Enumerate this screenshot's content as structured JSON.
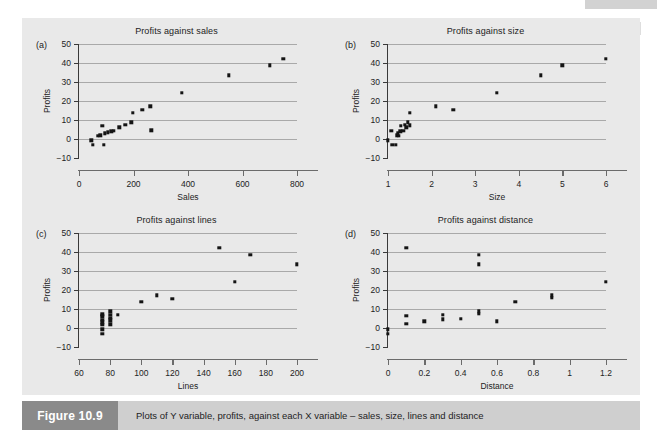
{
  "figure": {
    "label": "Figure 10.9",
    "caption": "Plots of Y variable, profits, against each X variable – sales, size, lines and distance",
    "panel_background": "#e9e9e9",
    "label_background": "#8a8a8a",
    "caption_background": "#cfcfcf",
    "marker_color": "#141414",
    "gridline_color": "#a9a9a9"
  },
  "panels": [
    {
      "letter": "(a)",
      "key": "sales"
    },
    {
      "letter": "(b)",
      "key": "size"
    },
    {
      "letter": "(c)",
      "key": "lines"
    },
    {
      "letter": "(d)",
      "key": "distance"
    }
  ],
  "chart_data": [
    {
      "id": "sales",
      "type": "scatter",
      "title": "Profits against sales",
      "xlabel": "Sales",
      "ylabel": "Profits",
      "xlim": [
        0,
        800
      ],
      "ylim": [
        -10,
        50
      ],
      "xticks": [
        0,
        200,
        400,
        600,
        800
      ],
      "yticks": [
        -10,
        0,
        10,
        20,
        30,
        40,
        50
      ],
      "xticklabels": [
        "0",
        "200",
        "400",
        "600",
        "800"
      ],
      "yticklabels": [
        "−10",
        "0",
        "10",
        "20",
        "30",
        "40",
        "50"
      ],
      "grid": "horizontal",
      "legend": "none",
      "points": [
        [
          45,
          -0.6
        ],
        [
          50,
          -3.2
        ],
        [
          70,
          1.7
        ],
        [
          78,
          2.0
        ],
        [
          85,
          6.8
        ],
        [
          90,
          -3.1
        ],
        [
          95,
          3.0
        ],
        [
          105,
          3.6
        ],
        [
          118,
          4.0
        ],
        [
          128,
          4.3
        ],
        [
          148,
          6.1
        ],
        [
          170,
          7.4
        ],
        [
          192,
          8.8
        ],
        [
          198,
          13.7
        ],
        [
          232,
          15.4
        ],
        [
          262,
          17.2
        ],
        [
          266,
          4.5
        ],
        [
          378,
          24.4
        ],
        [
          550,
          33.6
        ],
        [
          700,
          38.7
        ],
        [
          750,
          42.2
        ]
      ]
    },
    {
      "id": "size",
      "type": "scatter",
      "title": "Profits against size",
      "xlabel": "Size",
      "ylabel": "Profits",
      "xlim": [
        1,
        6
      ],
      "ylim": [
        -10,
        50
      ],
      "xticks": [
        1,
        2,
        3,
        4,
        5,
        6
      ],
      "yticks": [
        -10,
        0,
        10,
        20,
        30,
        40,
        50
      ],
      "xticklabels": [
        "1",
        "2",
        "3",
        "4",
        "5",
        "6"
      ],
      "yticklabels": [
        "−10",
        "0",
        "10",
        "20",
        "30",
        "40",
        "50"
      ],
      "grid": "horizontal",
      "legend": "none",
      "points": [
        [
          1.0,
          -0.6
        ],
        [
          1.08,
          4.3
        ],
        [
          1.1,
          -3.2
        ],
        [
          1.18,
          -3.1
        ],
        [
          1.2,
          2.0
        ],
        [
          1.22,
          3.0
        ],
        [
          1.25,
          1.7
        ],
        [
          1.28,
          4.0
        ],
        [
          1.3,
          6.8
        ],
        [
          1.35,
          4.3
        ],
        [
          1.38,
          7.4
        ],
        [
          1.42,
          6.1
        ],
        [
          1.45,
          8.8
        ],
        [
          1.5,
          7.2
        ],
        [
          1.5,
          13.7
        ],
        [
          2.1,
          17.2
        ],
        [
          2.5,
          15.4
        ],
        [
          3.5,
          24.4
        ],
        [
          4.5,
          33.6
        ],
        [
          5.0,
          38.7
        ],
        [
          6.0,
          42.2
        ]
      ]
    },
    {
      "id": "lines",
      "type": "scatter",
      "title": "Profits against lines",
      "xlabel": "Lines",
      "ylabel": "Profits",
      "xlim": [
        60,
        200
      ],
      "ylim": [
        -10,
        50
      ],
      "xticks": [
        60,
        80,
        100,
        120,
        140,
        160,
        180,
        200
      ],
      "yticks": [
        -10,
        0,
        10,
        20,
        30,
        40,
        50
      ],
      "xticklabels": [
        "60",
        "80",
        "100",
        "120",
        "140",
        "160",
        "180",
        "200"
      ],
      "yticklabels": [
        "−10",
        "0",
        "10",
        "20",
        "30",
        "40",
        "50"
      ],
      "grid": "horizontal",
      "legend": "none",
      "points": [
        [
          75,
          -3.2
        ],
        [
          75,
          -0.6
        ],
        [
          75,
          1.7
        ],
        [
          75,
          3.0
        ],
        [
          75,
          4.3
        ],
        [
          75,
          6.1
        ],
        [
          75,
          7.2
        ],
        [
          80,
          2.0
        ],
        [
          80,
          4.0
        ],
        [
          80,
          5.3
        ],
        [
          80,
          6.8
        ],
        [
          80,
          8.8
        ],
        [
          85,
          7.0
        ],
        [
          100,
          13.7
        ],
        [
          110,
          17.2
        ],
        [
          120,
          15.4
        ],
        [
          150,
          42.2
        ],
        [
          160,
          24.4
        ],
        [
          170,
          38.6
        ],
        [
          200,
          33.6
        ]
      ]
    },
    {
      "id": "distance",
      "type": "scatter",
      "title": "Profits against distance",
      "xlabel": "Distance",
      "ylabel": "Profits",
      "xlim": [
        0,
        1.2
      ],
      "ylim": [
        -10,
        50
      ],
      "xticks": [
        0,
        0.2,
        0.4,
        0.6,
        0.8,
        1.0,
        1.2
      ],
      "yticks": [
        -10,
        0,
        10,
        20,
        30,
        40,
        50
      ],
      "xticklabels": [
        "0",
        "0.2",
        "0.4",
        "0.6",
        "0.8",
        "1",
        "1.2"
      ],
      "yticklabels": [
        "−10",
        "0",
        "10",
        "20",
        "30",
        "40",
        "50"
      ],
      "grid": "horizontal",
      "legend": "none",
      "points": [
        [
          0.0,
          -0.6
        ],
        [
          0.0,
          -3.2
        ],
        [
          0.1,
          42.2
        ],
        [
          0.1,
          6.5
        ],
        [
          0.1,
          2.1
        ],
        [
          0.2,
          3.6
        ],
        [
          0.3,
          6.9
        ],
        [
          0.3,
          4.6
        ],
        [
          0.4,
          4.8
        ],
        [
          0.5,
          38.6
        ],
        [
          0.5,
          33.6
        ],
        [
          0.5,
          8.8
        ],
        [
          0.5,
          7.4
        ],
        [
          0.6,
          3.6
        ],
        [
          0.7,
          13.7
        ],
        [
          0.9,
          17.2
        ],
        [
          0.9,
          15.9
        ],
        [
          1.2,
          24.4
        ]
      ]
    }
  ]
}
